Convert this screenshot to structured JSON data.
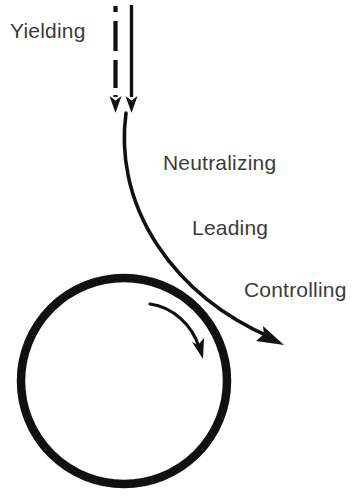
{
  "figure": {
    "title": "",
    "background_color": "#ffffff",
    "stroke_color": "#111111",
    "text_color": "#3b3b3b"
  },
  "labels": {
    "yielding": "Yielding",
    "neutralizing": "Neutralizing",
    "leading": "Leading",
    "controlling": "Controlling"
  },
  "elements": {
    "dashed_arrow": {
      "name": "dashed-down-arrow",
      "style": "dashed",
      "direction": "down",
      "x": 115,
      "y_start": 6,
      "y_end": 112
    },
    "solid_arrow": {
      "name": "solid-down-arrow",
      "style": "solid",
      "direction": "down",
      "x": 131,
      "y_start": 6,
      "y_end": 112
    },
    "main_curve": {
      "name": "redirecting-curve-arrow",
      "style": "solid",
      "direction": "down-right",
      "start": [
        126,
        112
      ],
      "end": [
        283,
        345
      ]
    },
    "circle": {
      "name": "large-circle",
      "center": [
        124,
        381
      ],
      "radius": 103,
      "stroke_width": 8
    },
    "inner_arc_arrow": {
      "name": "clockwise-arc-arrow",
      "direction": "clockwise",
      "start": [
        150,
        303
      ],
      "end": [
        202,
        357
      ]
    }
  }
}
